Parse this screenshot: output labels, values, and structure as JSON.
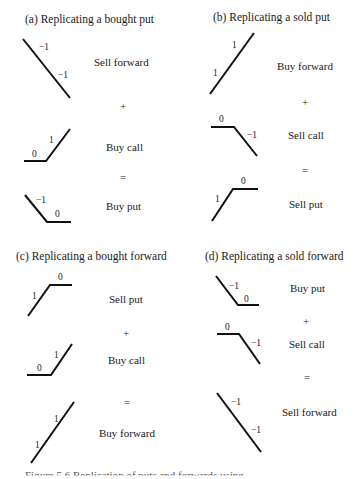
{
  "panels": {
    "a": {
      "title": "(a) Replicating a bought put",
      "rows": [
        {
          "label": "Sell forward",
          "numbers": [
            "−1",
            "−1"
          ]
        },
        {
          "label": "Buy call",
          "numbers": [
            "0",
            "1"
          ]
        },
        {
          "label": "Buy put",
          "numbers": [
            "−1",
            "0"
          ]
        }
      ],
      "ops": [
        "+",
        "="
      ]
    },
    "b": {
      "title": "(b) Replicating a sold put",
      "rows": [
        {
          "label": "Buy forward",
          "numbers": [
            "1",
            "1"
          ]
        },
        {
          "label": "Sell call",
          "numbers": [
            "0",
            "−1"
          ]
        },
        {
          "label": "Sell put",
          "numbers": [
            "1",
            "0"
          ]
        }
      ],
      "ops": [
        "+",
        "="
      ]
    },
    "c": {
      "title": "(c) Replicating a bought forward",
      "rows": [
        {
          "label": "Sell put",
          "numbers": [
            "1",
            "0"
          ]
        },
        {
          "label": "Buy call",
          "numbers": [
            "0",
            "1"
          ]
        },
        {
          "label": "Buy forward",
          "numbers": [
            "1",
            "1"
          ]
        }
      ],
      "ops": [
        "+",
        "="
      ]
    },
    "d": {
      "title": "(d) Replicating a sold forward",
      "rows": [
        {
          "label": "Buy put",
          "numbers": [
            "−1",
            "0"
          ]
        },
        {
          "label": "Sell call",
          "numbers": [
            "0",
            "−1"
          ]
        },
        {
          "label": "Sell forward",
          "numbers": [
            "−1",
            "−1"
          ]
        }
      ],
      "ops": [
        "+",
        "="
      ]
    }
  },
  "caption": "Figure 5.6   Replication of puts and forwards using ..."
}
